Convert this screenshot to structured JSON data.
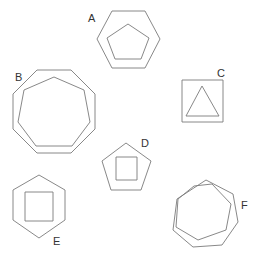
{
  "diagram": {
    "title": "",
    "stroke_color": "#7a7a7a",
    "label_color": "#333333",
    "figures": [
      {
        "id": "A",
        "label": "A",
        "outer": "hexagon",
        "inner": "pentagon",
        "label_pos": [
          88,
          22
        ],
        "outer_points": "112,11 145,11 160,39 145,68 112,68 97,39",
        "inner_points": "128,24 149,38 141,59 115,59 107,38"
      },
      {
        "id": "B",
        "label": "B",
        "outer": "octagon",
        "inner": "heptagon",
        "label_pos": [
          15,
          81
        ],
        "outer_points": "37,70 71,70 95,94 95,129 71,153 37,153 13,129 13,94",
        "inner_points": "54,77 84,90 90,122 72,146 36,146 18,122 24,90"
      },
      {
        "id": "C",
        "label": "C",
        "outer": "square",
        "inner": "triangle",
        "label_pos": [
          217,
          77
        ],
        "outer_points": "182,80 223,80 223,122 182,122",
        "inner_points": "202,86 219,116 186,116"
      },
      {
        "id": "D",
        "label": "D",
        "outer": "pentagon",
        "inner": "square",
        "label_pos": [
          141,
          147
        ],
        "outer_points": "126,143 151,161 141,190 111,190 102,161",
        "inner_points": "116,157 137,157 137,180 116,180"
      },
      {
        "id": "E",
        "label": "E",
        "outer": "hexagon",
        "inner": "square",
        "label_pos": [
          53,
          245
        ],
        "outer_points": "39,175 65,190 65,220 39,238 13,220 13,190",
        "inner_points": "25,192 53,192 53,221 25,221"
      },
      {
        "id": "F",
        "label": "F",
        "outer": "heptagon",
        "inner": "heptagon",
        "label_pos": [
          241,
          209
        ],
        "outer_points": "206,180 233,194 238,222 222,245 193,247 173,230 177,199",
        "inner_points": "212,184 231,204 226,230 198,240 176,227 178,199 194,186"
      }
    ]
  }
}
